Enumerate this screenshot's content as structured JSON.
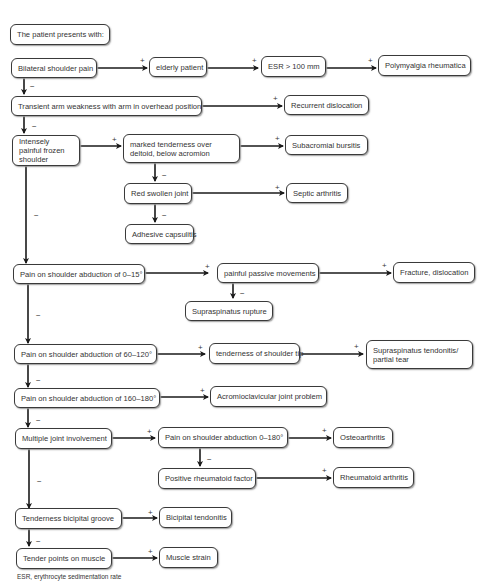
{
  "diagram": {
    "type": "clinical-decision-flowchart",
    "start": "The patient presents with:",
    "nodes": {
      "start": "The patient presents with:",
      "bilateral": "Bilateral shoulder pain",
      "elderly": "elderly patient",
      "esr": "ESR > 100 mm",
      "pmr": "Polymyalgia rheumatica",
      "transient": "Transient arm weakness with arm in overhead position",
      "recurrent": "Recurrent dislocation",
      "frozen": "Intensely painful frozen shoulder",
      "deltoid": "marked tenderness over deltoid, below acromion",
      "subacromial": "Subacromial bursitis",
      "redswollen": "Red swollen joint",
      "septic": "Septic arthritis",
      "adhesive": "Adhesive capsulitis",
      "abd0_15": "Pain on shoulder abduction of 0–15°",
      "passive": "painful passive movements",
      "fracture": "Fracture, dislocation",
      "rupture": "Supraspinatus rupture",
      "abd60_120": "Pain on shoulder abduction of 60–120°",
      "tip": "tenderness of shoulder tip",
      "tendonitis": "Supraspinatus tendonitis/ partial tear",
      "abd160_180": "Pain on shoulder abduction of 160–180°",
      "acj": "Acromioclavicular joint problem",
      "multiple": "Multiple joint involvement",
      "abd0_180": "Pain on shoulder abduction 0–180°",
      "oa": "Osteoarthritis",
      "rf": "Positive rheumatoid factor",
      "ra": "Rheumatoid arthritis",
      "bicipital_groove": "Tenderness bicipital groove",
      "bicipital_tend": "Bicipital tendonitis",
      "tender_points": "Tender points on muscle",
      "strain": "Muscle strain"
    },
    "edges": [
      {
        "from": "bilateral",
        "to": "elderly",
        "sign": "+"
      },
      {
        "from": "elderly",
        "to": "esr",
        "sign": "+"
      },
      {
        "from": "esr",
        "to": "pmr",
        "sign": "+"
      },
      {
        "from": "bilateral",
        "to": "transient",
        "sign": "−"
      },
      {
        "from": "transient",
        "to": "recurrent",
        "sign": "+"
      },
      {
        "from": "transient",
        "to": "frozen",
        "sign": "−"
      },
      {
        "from": "frozen",
        "to": "deltoid",
        "sign": "+"
      },
      {
        "from": "deltoid",
        "to": "subacromial",
        "sign": "+"
      },
      {
        "from": "deltoid",
        "to": "redswollen",
        "sign": "−"
      },
      {
        "from": "redswollen",
        "to": "septic",
        "sign": "+"
      },
      {
        "from": "redswollen",
        "to": "adhesive",
        "sign": "−"
      },
      {
        "from": "frozen",
        "to": "abd0_15",
        "sign": "−"
      },
      {
        "from": "abd0_15",
        "to": "passive",
        "sign": "+"
      },
      {
        "from": "passive",
        "to": "fracture",
        "sign": "+"
      },
      {
        "from": "passive",
        "to": "rupture",
        "sign": "−"
      },
      {
        "from": "abd0_15",
        "to": "abd60_120",
        "sign": "−"
      },
      {
        "from": "abd60_120",
        "to": "tip",
        "sign": "+"
      },
      {
        "from": "tip",
        "to": "tendonitis",
        "sign": "+"
      },
      {
        "from": "abd60_120",
        "to": "abd160_180",
        "sign": "−"
      },
      {
        "from": "abd160_180",
        "to": "acj",
        "sign": "+"
      },
      {
        "from": "abd160_180",
        "to": "multiple",
        "sign": "−"
      },
      {
        "from": "multiple",
        "to": "abd0_180",
        "sign": "+"
      },
      {
        "from": "abd0_180",
        "to": "oa",
        "sign": "+"
      },
      {
        "from": "abd0_180",
        "to": "rf",
        "sign": "−"
      },
      {
        "from": "rf",
        "to": "ra",
        "sign": "+"
      },
      {
        "from": "multiple",
        "to": "bicipital_groove",
        "sign": "−"
      },
      {
        "from": "bicipital_groove",
        "to": "bicipital_tend",
        "sign": "+"
      },
      {
        "from": "bicipital_groove",
        "to": "tender_points",
        "sign": "−"
      },
      {
        "from": "tender_points",
        "to": "strain",
        "sign": "+"
      }
    ],
    "signs": {
      "plus": "+",
      "minus": "−"
    },
    "footnote": "ESR, erythrocyte sedimentation rate"
  },
  "colors": {
    "stroke": "#1a1a1a",
    "box_border": "#3a3a3a",
    "text": "#333333",
    "background": "#ffffff"
  }
}
